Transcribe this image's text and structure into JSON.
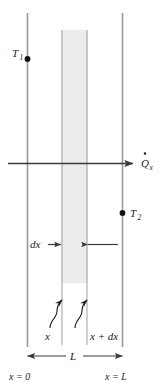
{
  "figure": {
    "type": "technical-diagram",
    "colors": {
      "wall_line": "#9a9a9a",
      "element_fill": "#ececec",
      "element_edge": "#b8b8b8",
      "annotation": "#3a3a3a",
      "text": "#1b1b1b",
      "background": "#ffffff"
    },
    "labels": {
      "t1": "T",
      "t1_sub": "1",
      "t2": "T",
      "t2_sub": "2",
      "qdot": "Q",
      "qdot_sub": "x",
      "dx": "dx",
      "x": "x",
      "x_plus_dx": "x + dx",
      "length": "L",
      "x_zero": "x = 0",
      "x_length": "x = L"
    },
    "geometry": {
      "left_wall_x": 27,
      "right_wall_x": 122,
      "element_left_x": 61,
      "element_right_x": 88,
      "heat_flow_y": 163,
      "thickness_label": "L"
    }
  }
}
